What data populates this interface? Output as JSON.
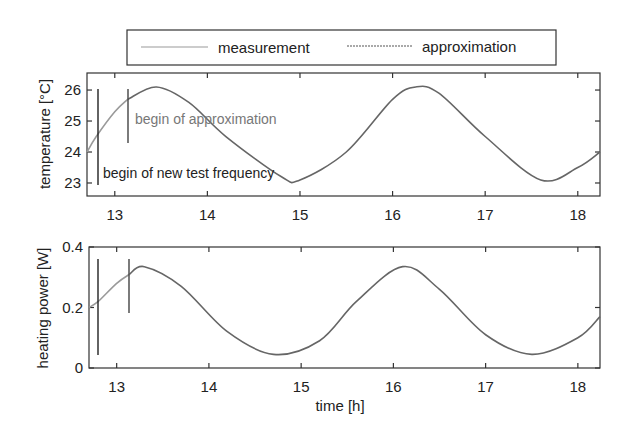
{
  "legend": {
    "items": [
      {
        "label": "measurement",
        "color": "#999999",
        "dash": "none"
      },
      {
        "label": "approximation",
        "color": "#555555",
        "dash": "2,1"
      }
    ]
  },
  "chart_data": [
    {
      "type": "line",
      "title": "",
      "xlabel": "",
      "ylabel": "temperature [°C]",
      "xlim": [
        12.7,
        18.24
      ],
      "ylim": [
        22.58,
        26.55
      ],
      "xticks": [
        13,
        14,
        15,
        16,
        17,
        18
      ],
      "yticks": [
        23,
        24,
        25,
        26
      ],
      "grid": false,
      "series": [
        {
          "name": "measurement",
          "x": [
            12.7,
            12.8,
            13.0,
            13.14
          ],
          "y": [
            24.0,
            24.5,
            25.3,
            25.7
          ]
        },
        {
          "name": "approximation",
          "x": [
            13.14,
            13.45,
            13.8,
            14.2,
            14.8,
            15.0,
            15.5,
            16.0,
            16.25,
            16.5,
            17.0,
            17.6,
            18.0,
            18.24
          ],
          "y": [
            25.7,
            26.1,
            25.6,
            24.5,
            23.2,
            23.1,
            24.0,
            25.7,
            26.1,
            25.9,
            24.5,
            23.1,
            23.5,
            24.0
          ]
        }
      ],
      "annotations": [
        {
          "text": "begin of approximation",
          "x": 13.14
        },
        {
          "text": "begin of new test frequency",
          "x": 12.8
        }
      ]
    },
    {
      "type": "line",
      "title": "",
      "xlabel": "time [h]",
      "ylabel": "heating power [W]",
      "xlim": [
        12.7,
        18.24
      ],
      "ylim": [
        0,
        0.4
      ],
      "xticks": [
        13,
        14,
        15,
        16,
        17,
        18
      ],
      "yticks": [
        0,
        0.2,
        0.4
      ],
      "grid": false,
      "series": [
        {
          "name": "measurement",
          "x": [
            12.7,
            12.8,
            13.0,
            13.14
          ],
          "y": [
            0.2,
            0.22,
            0.28,
            0.31
          ]
        },
        {
          "name": "approximation",
          "x": [
            13.14,
            13.3,
            13.7,
            14.2,
            14.7,
            15.2,
            15.6,
            16.1,
            16.5,
            17.0,
            17.5,
            18.0,
            18.24
          ],
          "y": [
            0.31,
            0.335,
            0.27,
            0.12,
            0.045,
            0.09,
            0.22,
            0.335,
            0.26,
            0.11,
            0.045,
            0.1,
            0.17
          ]
        }
      ],
      "annotations": []
    }
  ],
  "panels": {
    "top": {
      "ylabel": "temperature [°C]",
      "ytick_labels": [
        "26",
        "25",
        "24",
        "23"
      ],
      "xtick_labels": [
        "13",
        "14",
        "15",
        "16",
        "17",
        "18"
      ],
      "note_approx": "begin of approximation",
      "note_freq": "begin of new test frequency"
    },
    "bottom": {
      "ylabel": "heating power [W]",
      "ytick_labels": [
        "0.4",
        "0.2",
        "0"
      ],
      "xtick_labels": [
        "13",
        "14",
        "15",
        "16",
        "17",
        "18"
      ],
      "xlabel": "time [h]"
    }
  }
}
